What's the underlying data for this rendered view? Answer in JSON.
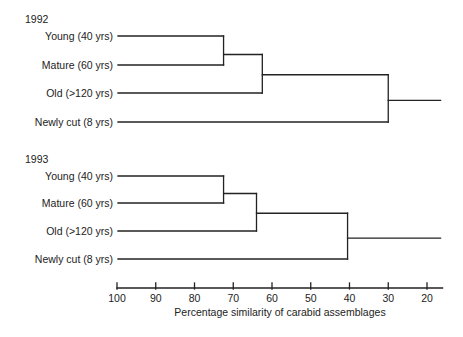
{
  "chart_data": {
    "type": "dendrogram",
    "title": "",
    "xlabel": "Percentage similarity of carabid assemblages",
    "ylabel": "",
    "xlim": [
      100,
      20
    ],
    "x_ticks": [
      100,
      90,
      80,
      70,
      60,
      50,
      40,
      30,
      20
    ],
    "grid": false,
    "panels": [
      {
        "year": "1992",
        "leaves": [
          "Young (40 yrs)",
          "Mature (60 yrs)",
          "Old (>120 yrs)",
          "Newly cut (8 yrs)"
        ],
        "merges": [
          {
            "join": [
              "Young (40 yrs)",
              "Mature (60 yrs)"
            ],
            "similarity": 72.5
          },
          {
            "join": [
              "Young+Mature",
              "Old (>120 yrs)"
            ],
            "similarity": 62.5
          },
          {
            "join": [
              "Young+Mature+Old",
              "Newly cut (8 yrs)"
            ],
            "similarity": 30
          }
        ]
      },
      {
        "year": "1993",
        "leaves": [
          "Young (40 yrs)",
          "Mature (60 yrs)",
          "Old (>120 yrs)",
          "Newly cut (8 yrs)"
        ],
        "merges": [
          {
            "join": [
              "Young (40 yrs)",
              "Mature (60 yrs)"
            ],
            "similarity": 72.5
          },
          {
            "join": [
              "Young+Mature",
              "Old (>120 yrs)"
            ],
            "similarity": 64
          },
          {
            "join": [
              "Young+Mature+Old",
              "Newly cut (8 yrs)"
            ],
            "similarity": 40.5
          }
        ]
      }
    ],
    "root_extends_to": 16.5
  },
  "layout": {
    "x_at_100": 117,
    "px_per_unit": 3.875,
    "line_start_x": 118,
    "panels": [
      {
        "year_y": 23,
        "leaf_y": [
          36,
          65,
          93,
          122
        ]
      },
      {
        "year_y": 163,
        "leaf_y": [
          176,
          203,
          231,
          259
        ]
      }
    ],
    "axis_y": 288,
    "line_color": "#222222"
  }
}
